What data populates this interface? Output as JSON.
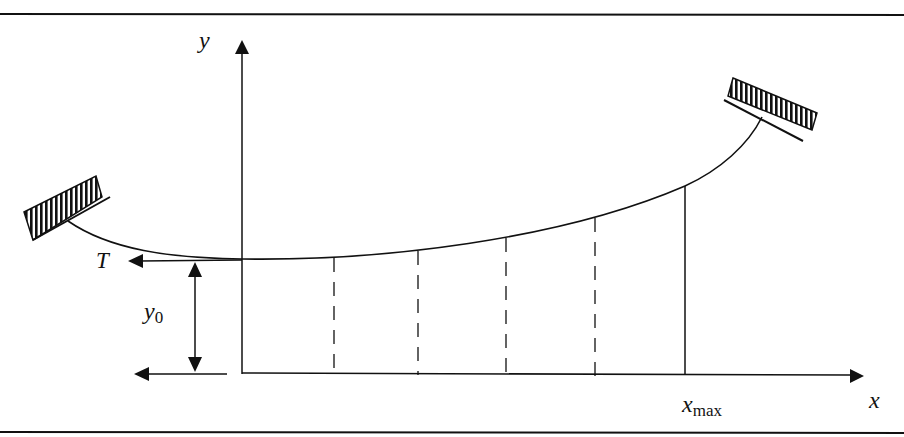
{
  "diagram": {
    "labels": {
      "y_axis": "y",
      "x_axis": "x",
      "tension": "T",
      "y0_main": "y",
      "y0_sub": "0",
      "xmax_main": "x",
      "xmax_sub": "max"
    },
    "elements": [
      "frame-top-line",
      "frame-bottom-line",
      "y-axis-arrow",
      "x-axis-arrow",
      "cable-curve",
      "left-support-clamp",
      "right-support-clamp",
      "tension-arrow",
      "y0-dimension-arrow",
      "baseline-reference-arrow",
      "dashed-ordinate-lines (4)",
      "xmax-ordinate-line"
    ],
    "colors": {
      "ink": "#111111",
      "background": "#ffffff"
    }
  }
}
